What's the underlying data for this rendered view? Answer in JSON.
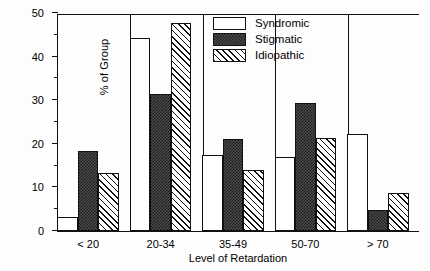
{
  "chart_data": {
    "type": "bar",
    "title": "",
    "subtitle": "",
    "xlabel": "Level of Retardation",
    "ylabel": "% of Group",
    "categories": [
      "< 20",
      "20-34",
      "35-49",
      "50-70",
      "> 70"
    ],
    "series": [
      {
        "name": "Syndromic",
        "fill": "open",
        "values": [
          3.1,
          44.3,
          17.5,
          17.0,
          22.3
        ]
      },
      {
        "name": "Stigmatic",
        "fill": "stipple",
        "values": [
          18.3,
          31.5,
          21.0,
          29.3,
          4.8
        ]
      },
      {
        "name": "Idiopathic",
        "fill": "hatch",
        "values": [
          13.3,
          47.8,
          14.0,
          21.3,
          8.8
        ]
      }
    ],
    "ylim": [
      0,
      50
    ],
    "y_ticks_major": [
      0,
      10,
      20,
      30,
      40,
      50
    ],
    "y_tick_labels": [
      "0",
      "10",
      "20",
      "30",
      "40",
      "50"
    ],
    "y_ticks_minor": [
      5,
      15,
      25,
      35,
      45
    ],
    "grid": false,
    "legend_position": "top-right",
    "legend_entries": [
      "Syndromic",
      "Stigmatic",
      "Idiopathic"
    ],
    "colors": {
      "axis": "#111111",
      "open_fill": "#ffffff",
      "stipple_fill": "#3a3a3a",
      "hatch_fill": "#ffffff",
      "background": "#ffffff"
    }
  }
}
